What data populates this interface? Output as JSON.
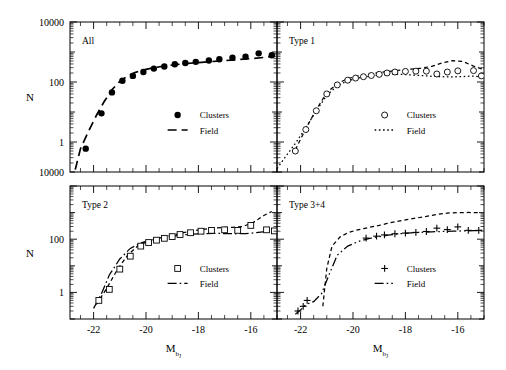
{
  "figure": {
    "title": "",
    "axis": {
      "ylabel": "N",
      "xlabel_base": "M",
      "xlabel_sub": "b",
      "xlabel_subsub": "J",
      "xticks": [
        "-22",
        "-20",
        "-18",
        "-16"
      ],
      "xtick_values": [
        -22,
        -20,
        -18,
        -16
      ],
      "xlim": [
        -22.9,
        -15.0
      ],
      "ylim_decades": [
        -1,
        4
      ],
      "ytick_top_label": "10000",
      "ytick_mid_label": "100",
      "ytick_low_label": "1",
      "ytick_bottom_label": "10000",
      "ytick_labels_lower": [
        "100",
        "1"
      ]
    },
    "legend": {
      "clusters_label": "Clusters",
      "field_label": "Field"
    }
  },
  "chart_data": {
    "type": "line",
    "title": "",
    "xlabel": "M_bJ",
    "ylabel": "N",
    "xlim": [
      -22.9,
      -15.0
    ],
    "ylim": [
      0.1,
      10000
    ],
    "yscale": "log",
    "grid": false,
    "legend_position": "center-right",
    "panels": [
      {
        "id": "all",
        "label": "All",
        "position": "top-left",
        "marker": "filled-circle",
        "field_linestyle": "dashed",
        "series": [
          {
            "name": "Clusters",
            "marker": "filled-circle",
            "x": [
              -22.3,
              -21.7,
              -21.3,
              -20.9,
              -20.5,
              -20.1,
              -19.7,
              -19.3,
              -18.9,
              -18.5,
              -18.1,
              -17.6,
              -17.2,
              -16.7,
              -16.2,
              -15.7,
              -15.2
            ],
            "y": [
              0.6,
              9.0,
              45.0,
              110.0,
              160.0,
              215.0,
              280.0,
              330.0,
              390.0,
              430.0,
              470.0,
              520.0,
              570.0,
              640.0,
              700.0,
              900.0,
              780.0
            ]
          },
          {
            "name": "Field",
            "linestyle": "dashed",
            "x": [
              -22.7,
              -22.5,
              -22.2,
              -21.9,
              -21.6,
              -21.3,
              -21.0,
              -20.7,
              -20.4,
              -20.0,
              -19.6,
              -19.2,
              -18.8,
              -18.4,
              -18.0,
              -17.5,
              -17.0,
              -16.5,
              -16.0,
              -15.5,
              -15.1
            ],
            "y": [
              0.12,
              0.6,
              2.2,
              7.5,
              22.0,
              55.0,
              105.0,
              160.0,
              210.0,
              265.0,
              310.0,
              350.0,
              385.0,
              415.0,
              445.0,
              480.0,
              515.0,
              555.0,
              600.0,
              660.0,
              720.0
            ]
          }
        ]
      },
      {
        "id": "type1",
        "label": "Type 1",
        "position": "top-right",
        "marker": "open-circle",
        "field_linestyle": "dotted",
        "series": [
          {
            "name": "Clusters",
            "marker": "open-circle",
            "x": [
              -22.2,
              -21.8,
              -21.4,
              -21.0,
              -20.6,
              -20.2,
              -19.9,
              -19.6,
              -19.3,
              -19.0,
              -18.7,
              -18.4,
              -18.0,
              -17.6,
              -17.2,
              -16.8,
              -16.4,
              -16.0,
              -15.4,
              -15.1
            ],
            "y": [
              0.5,
              2.6,
              11.0,
              40.0,
              80.0,
              115.0,
              135.0,
              150.0,
              165.0,
              180.0,
              200.0,
              215.0,
              225.0,
              230.0,
              230.0,
              185.0,
              215.0,
              235.0,
              240.0,
              160.0
            ]
          },
          {
            "name": "Field",
            "linestyle": "dotted",
            "x": [
              -22.9,
              -22.6,
              -22.2,
              -21.8,
              -21.4,
              -21.0,
              -20.6,
              -20.2,
              -19.8,
              -19.4,
              -19.0,
              -18.6,
              -18.2,
              -17.8,
              -17.4,
              -17.0,
              -16.6,
              -16.2,
              -15.8,
              -15.4,
              -15.0
            ],
            "y": [
              0.13,
              0.3,
              0.9,
              3.0,
              11.0,
              36.0,
              75.0,
              110.0,
              135.0,
              155.0,
              170.0,
              180.0,
              180.0,
              172.0,
              165.0,
              155.0,
              150.0,
              148.0,
              152.0,
              158.0,
              140.0
            ]
          },
          {
            "name": "All-reference",
            "linestyle": "dashed-thin",
            "x": [
              -22.2,
              -21.8,
              -21.4,
              -21.0,
              -20.6,
              -20.2,
              -19.8,
              -19.4,
              -19.0,
              -18.6,
              -18.2,
              -17.8,
              -17.4,
              -17.0,
              -16.6,
              -16.2,
              -15.8,
              -15.4,
              -15.0
            ],
            "y": [
              0.55,
              2.8,
              12.0,
              44.0,
              88.0,
              130.0,
              160.0,
              185.0,
              205.0,
              228.0,
              250.0,
              268.0,
              290.0,
              330.0,
              430.0,
              520.0,
              480.0,
              340.0,
              260.0
            ]
          }
        ]
      },
      {
        "id": "type2",
        "label": "Type 2",
        "position": "bottom-left",
        "marker": "open-square",
        "field_linestyle": "dash-dot",
        "series": [
          {
            "name": "Clusters",
            "marker": "open-square",
            "x": [
              -21.8,
              -21.4,
              -21.0,
              -20.6,
              -20.2,
              -19.9,
              -19.6,
              -19.3,
              -19.0,
              -18.7,
              -18.3,
              -17.9,
              -17.5,
              -17.0,
              -16.5,
              -16.0,
              -15.4,
              -15.1
            ],
            "y": [
              0.5,
              1.3,
              7.5,
              23.0,
              55.0,
              75.0,
              92.0,
              108.0,
              125.0,
              150.0,
              175.0,
              200.0,
              215.0,
              225.0,
              215.0,
              330.0,
              225.0,
              205.0
            ]
          },
          {
            "name": "Field",
            "linestyle": "dash-dot",
            "x": [
              -22.0,
              -21.7,
              -21.4,
              -21.0,
              -20.6,
              -20.2,
              -19.8,
              -19.4,
              -19.0,
              -18.6,
              -18.2,
              -17.8,
              -17.4,
              -17.0,
              -16.6,
              -16.2,
              -15.8,
              -15.4,
              -15.0
            ],
            "y": [
              0.25,
              0.9,
              4.5,
              18.0,
              45.0,
              72.0,
              95.0,
              115.0,
              130.0,
              145.0,
              155.0,
              163.0,
              165.0,
              163.0,
              160.0,
              163.0,
              175.0,
              195.0,
              200.0
            ]
          },
          {
            "name": "All-reference",
            "linestyle": "dashed-thin",
            "x": [
              -21.9,
              -21.5,
              -21.1,
              -20.7,
              -20.3,
              -19.9,
              -19.5,
              -19.1,
              -18.7,
              -18.3,
              -17.9,
              -17.5,
              -17.1,
              -16.7,
              -16.3,
              -15.9,
              -15.5,
              -15.2
            ],
            "y": [
              0.35,
              1.4,
              7.0,
              25.0,
              58.0,
              85.0,
              110.0,
              135.0,
              165.0,
              200.0,
              230.0,
              255.0,
              275.0,
              280.0,
              300.0,
              430.0,
              780.0,
              1100.0
            ]
          }
        ]
      },
      {
        "id": "type34",
        "label": "Type 3+4",
        "position": "bottom-right",
        "marker": "plus",
        "field_linestyle": "dash-dot-dot",
        "series": [
          {
            "name": "Clusters",
            "marker": "plus",
            "x": [
              -22.1,
              -21.9,
              -21.75,
              -19.5,
              -19.1,
              -18.8,
              -18.4,
              -18.0,
              -17.6,
              -17.2,
              -16.8,
              -16.4,
              -16.0,
              -15.6,
              -15.2
            ],
            "y": [
              0.2,
              0.3,
              0.5,
              110.0,
              130.0,
              145.0,
              160.0,
              170.0,
              180.0,
              195.0,
              260.0,
              230.0,
              290.0,
              215.0,
              215.0
            ]
          },
          {
            "name": "Field",
            "linestyle": "dash-dot-dot",
            "x": [
              -22.2,
              -22.0,
              -21.8,
              -21.5,
              -21.2,
              -20.9,
              -20.6,
              -20.2,
              -19.8,
              -19.4,
              -19.0,
              -18.6,
              -18.2,
              -17.8,
              -17.4,
              -17.0,
              -16.6,
              -16.2,
              -15.8,
              -15.4,
              -15.0
            ],
            "y": [
              0.15,
              0.22,
              0.35,
              0.45,
              0.9,
              5.0,
              25.0,
              55.0,
              82.0,
              105.0,
              125.0,
              145.0,
              160.0,
              172.0,
              182.0,
              190.0,
              195.0,
              200.0,
              205.0,
              210.0,
              215.0
            ]
          },
          {
            "name": "All-reference",
            "linestyle": "dashed-thin",
            "x": [
              -21.15,
              -21.0,
              -20.8,
              -20.5,
              -20.2,
              -19.9,
              -19.6,
              -19.3,
              -19.0,
              -18.7,
              -18.4,
              -18.0,
              -17.6,
              -17.2,
              -16.8,
              -16.4,
              -16.0,
              -15.6,
              -15.2
            ],
            "y": [
              0.3,
              8.0,
              55.0,
              120.0,
              175.0,
              215.0,
              250.0,
              290.0,
              330.0,
              390.0,
              450.0,
              530.0,
              620.0,
              720.0,
              860.0,
              960.0,
              1000.0,
              1010.0,
              1000.0
            ]
          }
        ]
      }
    ]
  }
}
